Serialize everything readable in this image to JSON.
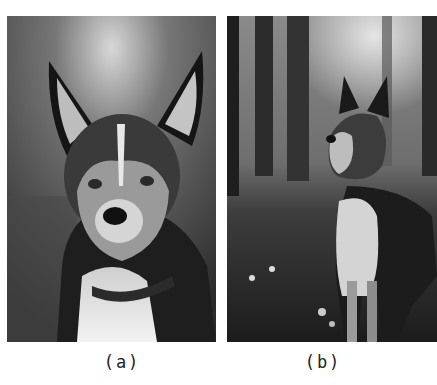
{
  "figure": {
    "panels": [
      {
        "id": "a",
        "caption": "(a)",
        "description": "Close-up grayscale portrait of a dog with upright ears in a blurred forest"
      },
      {
        "id": "b",
        "caption": "(b)",
        "description": "Grayscale photo of a dog standing in a misty forest clearing with small flowers"
      }
    ]
  }
}
